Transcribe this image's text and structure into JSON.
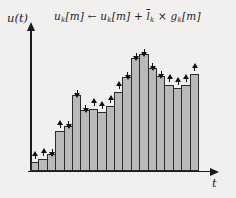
{
  "figure": {
    "background_color": "#f2f0ee"
  },
  "axes": {
    "y_label": "u(t)",
    "x_label": "t"
  },
  "formula": {
    "plain": "uₖ[m] ← uₖ[m] + l̄ₖ × gₖ[m]",
    "tokens": [
      {
        "t": "u"
      },
      {
        "t": "k",
        "cls": "sub"
      },
      {
        "t": "[m]"
      },
      {
        "t": " ← "
      },
      {
        "t": "u"
      },
      {
        "t": "k",
        "cls": "sub"
      },
      {
        "t": "[m]"
      },
      {
        "t": " + "
      },
      {
        "t": "l",
        "cls": "ov"
      },
      {
        "t": "k",
        "cls": "sub"
      },
      {
        "t": " × "
      },
      {
        "t": "g"
      },
      {
        "t": "k",
        "cls": "sub"
      },
      {
        "t": "[m]"
      }
    ]
  },
  "chart_data": {
    "type": "bar",
    "title": "",
    "xlabel": "t",
    "ylabel": "u(t)",
    "annotation": "u_k[m] ← u_k[m] + l̄_k × g_k[m]",
    "ylim": [
      0,
      120
    ],
    "grid": false,
    "legend": "none",
    "values": [
      9,
      12,
      17,
      40,
      45,
      76,
      61,
      62,
      59,
      65,
      79,
      94,
      113,
      117,
      103,
      95,
      86,
      83,
      86,
      97
    ],
    "arrow_directions": [
      "up",
      "up",
      "down",
      "up",
      "down",
      "down",
      "down",
      "up",
      "up",
      "up",
      "up",
      "down",
      "down",
      "down",
      "down",
      "down",
      "up",
      "up",
      "up",
      "up"
    ],
    "bar_color": "#b9b9b9",
    "bar_border_color": "#2b2b2b",
    "arrow_color": "#111111"
  }
}
